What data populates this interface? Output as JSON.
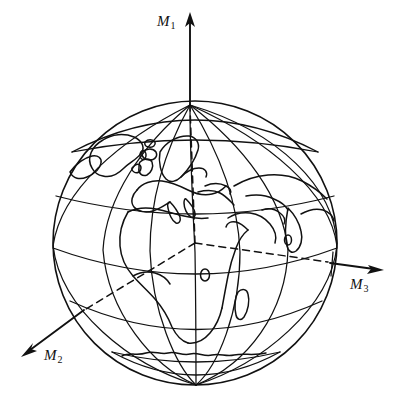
{
  "figure": {
    "kind": "line-drawing",
    "background_color": "#ffffff",
    "ink_color": "#111111",
    "width": 402,
    "height": 406
  },
  "globe": {
    "center_x": 195,
    "center_y": 243,
    "radius": 142,
    "north_pole": {
      "x": 190,
      "y": 105
    },
    "parallels_count": 6,
    "meridians_count": 9,
    "landmasses": [
      "Greenland",
      "Iceland",
      "British Isles",
      "Scandinavia",
      "Europe",
      "Africa",
      "Arabian Peninsula",
      "India",
      "Madagascar",
      "Antarctica"
    ]
  },
  "axes": [
    {
      "id": "m1",
      "label": "M",
      "subscript": "1",
      "direction": "up",
      "tip": {
        "x": 190,
        "y": 14
      },
      "tail": {
        "x": 190,
        "y": 105
      }
    },
    {
      "id": "m2",
      "label": "M",
      "subscript": "2",
      "direction": "down-left",
      "tip": {
        "x": 22,
        "y": 355
      },
      "tail": {
        "x": 83,
        "y": 310
      }
    },
    {
      "id": "m3",
      "label": "M",
      "subscript": "3",
      "direction": "right",
      "tip": {
        "x": 383,
        "y": 270
      },
      "tail": {
        "x": 330,
        "y": 263
      }
    }
  ]
}
